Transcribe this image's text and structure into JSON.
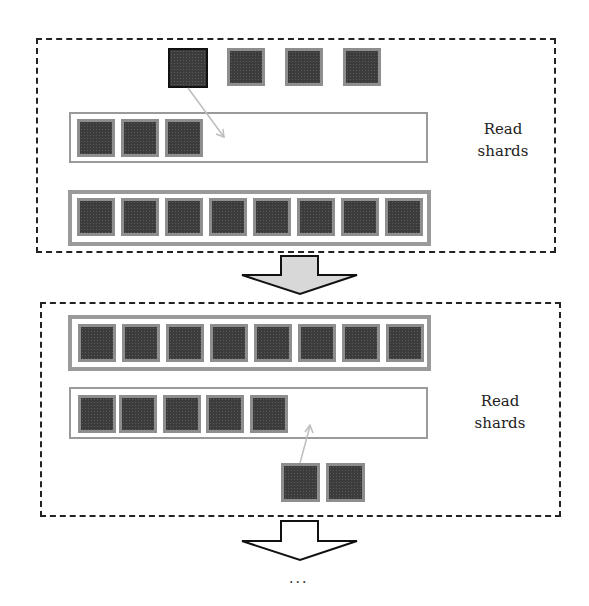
{
  "diagram": {
    "type": "shard-reading-process",
    "panels": [
      {
        "id": "panel-1",
        "label": "Read\nshards",
        "label_lines": [
          "Read",
          "shards"
        ],
        "pending_shards": 4,
        "active_shard_index": 0,
        "partial_buffer_shards": 3,
        "full_buffer_shards": 8,
        "buffer_capacity": 8,
        "arrow": "pending shard moves into partial buffer"
      },
      {
        "id": "panel-2",
        "label": "Read\nshards",
        "label_lines": [
          "Read",
          "shards"
        ],
        "full_buffer_shards": 8,
        "partial_buffer_shards": 5,
        "pending_shards": 2,
        "buffer_capacity": 8,
        "arrow": "pending shard moves into partial buffer"
      }
    ],
    "transition_arrows": [
      {
        "fill": "#d8d8d8",
        "style": "filled"
      },
      {
        "fill": "#ffffff",
        "style": "outline"
      }
    ],
    "continuation": "...",
    "colors": {
      "shard_fill": "#3c3c3c",
      "shard_border": "#8e8e8e",
      "frame_border": "#9a9a9a",
      "panel_border": "#222222"
    }
  }
}
